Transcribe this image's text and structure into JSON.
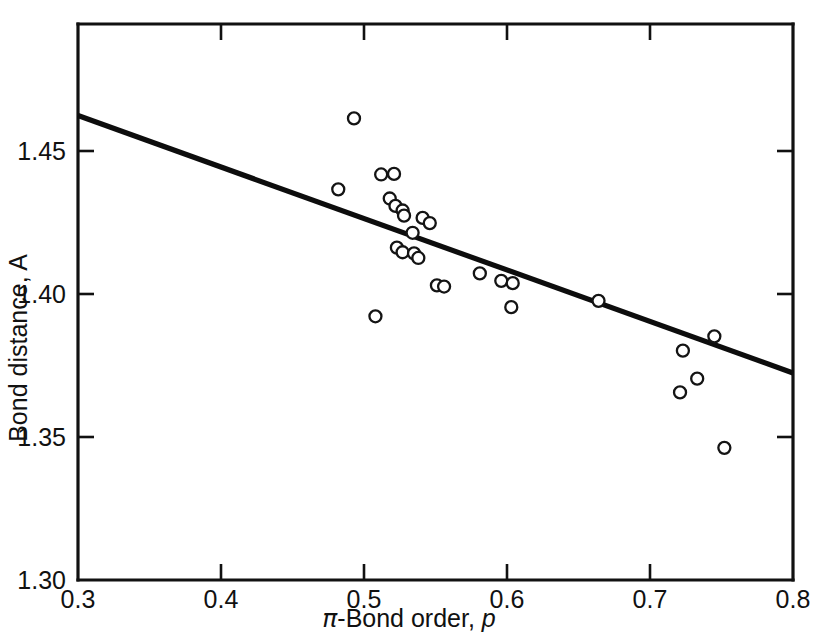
{
  "chart_data": {
    "type": "scatter",
    "title": "",
    "xlabel": "π-Bond order, p",
    "xlabel_parts": {
      "symbol": "π",
      "text": "-Bond order, ",
      "variable": "p"
    },
    "ylabel": "Bond distance, A",
    "xlim": [
      0.3,
      0.8
    ],
    "ylim": [
      1.3,
      1.5
    ],
    "grid": false,
    "legend": "none",
    "xticks": [
      0.3,
      0.4,
      0.5,
      0.6,
      0.7,
      0.8
    ],
    "xtick_labels": [
      "0.3",
      "0.4",
      "0.5",
      "0.6",
      "0.7",
      "0.8"
    ],
    "yticks": [
      1.3,
      1.35,
      1.4,
      1.45
    ],
    "ytick_labels": [
      "1.30",
      "1.35",
      "1.40",
      "1.45"
    ],
    "marker": "open-circle",
    "marker_radius_px": 6,
    "points": [
      {
        "x": 0.493,
        "y": 1.4614
      },
      {
        "x": 0.482,
        "y": 1.4366
      },
      {
        "x": 0.512,
        "y": 1.4418
      },
      {
        "x": 0.521,
        "y": 1.442
      },
      {
        "x": 0.518,
        "y": 1.4334
      },
      {
        "x": 0.522,
        "y": 1.4308
      },
      {
        "x": 0.527,
        "y": 1.4292
      },
      {
        "x": 0.528,
        "y": 1.4274
      },
      {
        "x": 0.541,
        "y": 1.4266
      },
      {
        "x": 0.546,
        "y": 1.4248
      },
      {
        "x": 0.534,
        "y": 1.4214
      },
      {
        "x": 0.523,
        "y": 1.4162
      },
      {
        "x": 0.527,
        "y": 1.4146
      },
      {
        "x": 0.535,
        "y": 1.4142
      },
      {
        "x": 0.538,
        "y": 1.4126
      },
      {
        "x": 0.581,
        "y": 1.4072
      },
      {
        "x": 0.596,
        "y": 1.4046
      },
      {
        "x": 0.604,
        "y": 1.4038
      },
      {
        "x": 0.551,
        "y": 1.403
      },
      {
        "x": 0.556,
        "y": 1.4026
      },
      {
        "x": 0.603,
        "y": 1.3954
      },
      {
        "x": 0.664,
        "y": 1.3976
      },
      {
        "x": 0.508,
        "y": 1.3922
      },
      {
        "x": 0.745,
        "y": 1.3852
      },
      {
        "x": 0.723,
        "y": 1.3802
      },
      {
        "x": 0.733,
        "y": 1.3704
      },
      {
        "x": 0.721,
        "y": 1.3656
      },
      {
        "x": 0.752,
        "y": 1.3462
      }
    ],
    "fit_line": {
      "label": "least-squares fit",
      "x0": 0.3,
      "y0": 1.4624,
      "x1": 0.8,
      "y1": 1.3724
    }
  }
}
